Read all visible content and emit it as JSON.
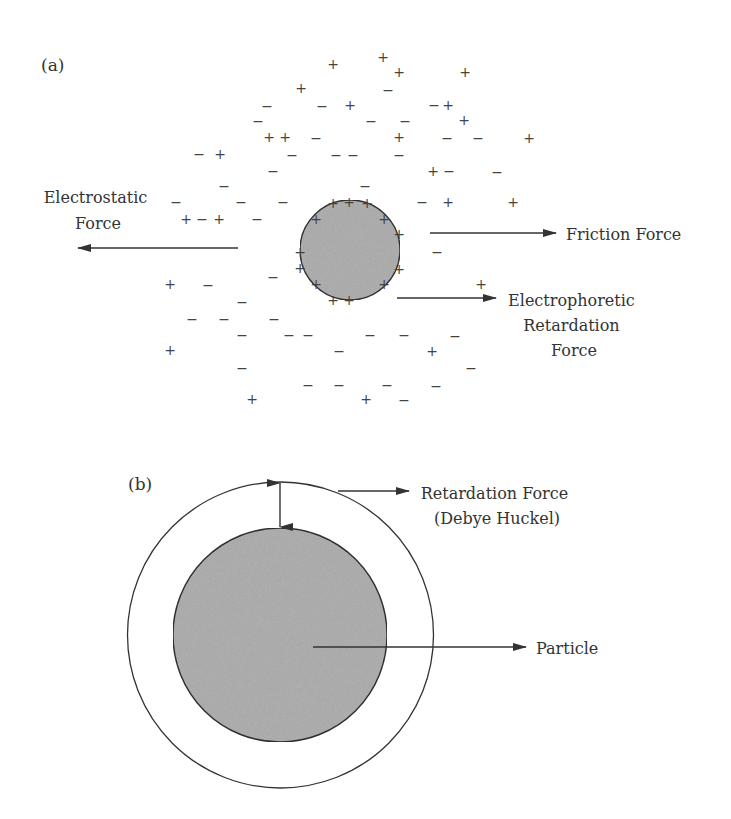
{
  "panel_a": {
    "label": "(a)",
    "particle": {
      "cx": 350,
      "cy": 250,
      "r": 50,
      "fill": "#b3b3b3"
    },
    "surface_charges": [
      {
        "x": 333,
        "y": 203
      },
      {
        "x": 349,
        "y": 202
      },
      {
        "x": 367,
        "y": 203
      },
      {
        "x": 316,
        "y": 219
      },
      {
        "x": 384,
        "y": 219
      },
      {
        "x": 399,
        "y": 234
      },
      {
        "x": 300,
        "y": 252
      },
      {
        "x": 300,
        "y": 268
      },
      {
        "x": 399,
        "y": 269
      },
      {
        "x": 316,
        "y": 284
      },
      {
        "x": 384,
        "y": 284
      },
      {
        "x": 333,
        "y": 300
      },
      {
        "x": 349,
        "y": 300
      }
    ],
    "ions": [
      {
        "s": "+",
        "x": 333,
        "y": 64
      },
      {
        "s": "+",
        "x": 383,
        "y": 57
      },
      {
        "s": "+",
        "x": 301,
        "y": 88
      },
      {
        "s": "+",
        "x": 399,
        "y": 72
      },
      {
        "s": "+",
        "x": 465,
        "y": 72
      },
      {
        "s": "−",
        "x": 388,
        "y": 90
      },
      {
        "s": "−",
        "x": 267,
        "y": 106
      },
      {
        "s": "−",
        "x": 322,
        "y": 106
      },
      {
        "s": "+",
        "x": 350,
        "y": 105
      },
      {
        "s": "−",
        "x": 434,
        "y": 105
      },
      {
        "s": "+",
        "x": 448,
        "y": 105
      },
      {
        "s": "−",
        "x": 258,
        "y": 121
      },
      {
        "s": "−",
        "x": 371,
        "y": 121
      },
      {
        "s": "−",
        "x": 405,
        "y": 121
      },
      {
        "s": "+",
        "x": 464,
        "y": 120
      },
      {
        "s": "+",
        "x": 269,
        "y": 137
      },
      {
        "s": "+",
        "x": 285,
        "y": 137
      },
      {
        "s": "−",
        "x": 316,
        "y": 138
      },
      {
        "s": "+",
        "x": 399,
        "y": 137
      },
      {
        "s": "−",
        "x": 447,
        "y": 138
      },
      {
        "s": "−",
        "x": 478,
        "y": 138
      },
      {
        "s": "+",
        "x": 529,
        "y": 138
      },
      {
        "s": "−",
        "x": 199,
        "y": 154
      },
      {
        "s": "+",
        "x": 220,
        "y": 154
      },
      {
        "s": "−",
        "x": 292,
        "y": 155
      },
      {
        "s": "−",
        "x": 336,
        "y": 155
      },
      {
        "s": "−",
        "x": 353,
        "y": 155
      },
      {
        "s": "−",
        "x": 399,
        "y": 155
      },
      {
        "s": "−",
        "x": 273,
        "y": 171
      },
      {
        "s": "+",
        "x": 433,
        "y": 171
      },
      {
        "s": "−",
        "x": 449,
        "y": 171
      },
      {
        "s": "−",
        "x": 497,
        "y": 172
      },
      {
        "s": "−",
        "x": 224,
        "y": 186
      },
      {
        "s": "−",
        "x": 365,
        "y": 186
      },
      {
        "s": "−",
        "x": 176,
        "y": 202
      },
      {
        "s": "−",
        "x": 241,
        "y": 202
      },
      {
        "s": "−",
        "x": 283,
        "y": 202
      },
      {
        "s": "−",
        "x": 422,
        "y": 202
      },
      {
        "s": "+",
        "x": 448,
        "y": 202
      },
      {
        "s": "+",
        "x": 513,
        "y": 202
      },
      {
        "s": "+",
        "x": 186,
        "y": 219
      },
      {
        "s": "−",
        "x": 202,
        "y": 219
      },
      {
        "s": "+",
        "x": 219,
        "y": 219
      },
      {
        "s": "−",
        "x": 257,
        "y": 219
      },
      {
        "s": "−",
        "x": 437,
        "y": 252
      },
      {
        "s": "−",
        "x": 273,
        "y": 277
      },
      {
        "s": "+",
        "x": 170,
        "y": 284
      },
      {
        "s": "−",
        "x": 208,
        "y": 285
      },
      {
        "s": "+",
        "x": 481,
        "y": 284
      },
      {
        "s": "−",
        "x": 242,
        "y": 302
      },
      {
        "s": "−",
        "x": 192,
        "y": 319
      },
      {
        "s": "−",
        "x": 224,
        "y": 319
      },
      {
        "s": "−",
        "x": 274,
        "y": 319
      },
      {
        "s": "−",
        "x": 242,
        "y": 335
      },
      {
        "s": "−",
        "x": 289,
        "y": 335
      },
      {
        "s": "−",
        "x": 308,
        "y": 335
      },
      {
        "s": "−",
        "x": 370,
        "y": 335
      },
      {
        "s": "−",
        "x": 404,
        "y": 335
      },
      {
        "s": "−",
        "x": 455,
        "y": 336
      },
      {
        "s": "+",
        "x": 170,
        "y": 350
      },
      {
        "s": "−",
        "x": 339,
        "y": 351
      },
      {
        "s": "+",
        "x": 432,
        "y": 351
      },
      {
        "s": "−",
        "x": 242,
        "y": 368
      },
      {
        "s": "−",
        "x": 471,
        "y": 368
      },
      {
        "s": "−",
        "x": 308,
        "y": 385
      },
      {
        "s": "−",
        "x": 339,
        "y": 385
      },
      {
        "s": "−",
        "x": 387,
        "y": 385
      },
      {
        "s": "−",
        "x": 436,
        "y": 386
      },
      {
        "s": "+",
        "x": 252,
        "y": 399
      },
      {
        "s": "+",
        "x": 366,
        "y": 399
      },
      {
        "s": "−",
        "x": 404,
        "y": 400
      }
    ],
    "forces": {
      "electrostatic": {
        "lines": [
          "Electrostatic",
          "Force"
        ],
        "arrow": {
          "x1": 238,
          "y1": 248,
          "x2": 78,
          "y2": 248
        }
      },
      "friction": {
        "lines": [
          "Friction Force"
        ],
        "arrow": {
          "x1": 430,
          "y1": 233,
          "x2": 556,
          "y2": 233
        }
      },
      "electrophoretic": {
        "lines": [
          "Electrophoretic",
          "Retardation",
          "Force"
        ],
        "arrow": {
          "x1": 397,
          "y1": 298,
          "x2": 496,
          "y2": 298
        }
      }
    }
  },
  "panel_b": {
    "label": "(b)",
    "outer_layer": {
      "cx": 280.5,
      "cy": 635,
      "r": 153
    },
    "particle": {
      "cx": 280,
      "cy": 635,
      "r": 107,
      "fill": "#b3b3b3"
    },
    "thickness_arrow": {
      "x": 280,
      "y1": 483,
      "y2": 527
    },
    "retardation": {
      "lines": [
        "Retardation Force",
        "(Debye Huckel)"
      ],
      "arrow": {
        "x1": 338,
        "y1": 491,
        "x2": 409,
        "y2": 491
      }
    },
    "particle_pointer": {
      "lines": [
        "Particle"
      ],
      "arrow": {
        "x1": 313,
        "y1": 647,
        "x2": 526,
        "y2": 647
      }
    }
  }
}
